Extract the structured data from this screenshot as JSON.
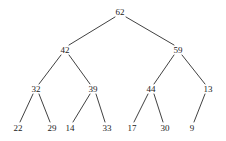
{
  "figure": {
    "kind": "binary-tree-diagram",
    "background_color": "#ffffff",
    "edge_color": "#2b2b2b",
    "text_color": "#1a1a1a",
    "width": 226,
    "height": 141
  },
  "nodes": [
    {
      "id": "n62",
      "label": "62",
      "x": 120,
      "y": 12,
      "level": 0
    },
    {
      "id": "n42",
      "label": "42",
      "x": 65,
      "y": 50,
      "level": 1
    },
    {
      "id": "n59",
      "label": "59",
      "x": 178,
      "y": 50,
      "level": 1
    },
    {
      "id": "n32",
      "label": "32",
      "x": 36,
      "y": 89,
      "level": 2
    },
    {
      "id": "n39",
      "label": "39",
      "x": 93,
      "y": 89,
      "level": 2
    },
    {
      "id": "n44",
      "label": "44",
      "x": 151,
      "y": 89,
      "level": 2
    },
    {
      "id": "n13",
      "label": "13",
      "x": 208,
      "y": 89,
      "level": 2
    },
    {
      "id": "n22",
      "label": "22",
      "x": 18,
      "y": 128,
      "level": 3
    },
    {
      "id": "n29",
      "label": "29",
      "x": 52,
      "y": 128,
      "level": 3
    },
    {
      "id": "n14",
      "label": "14",
      "x": 70,
      "y": 128,
      "level": 3
    },
    {
      "id": "n33",
      "label": "33",
      "x": 107,
      "y": 128,
      "level": 3
    },
    {
      "id": "n17",
      "label": "17",
      "x": 132,
      "y": 128,
      "level": 3
    },
    {
      "id": "n30",
      "label": "30",
      "x": 165,
      "y": 128,
      "level": 3
    },
    {
      "id": "n9",
      "label": "9",
      "x": 192,
      "y": 128,
      "level": 3
    }
  ],
  "edges": [
    {
      "from": "n62",
      "to": "n42",
      "x1": 115,
      "y1": 17,
      "x2": 69,
      "y2": 45
    },
    {
      "from": "n62",
      "to": "n59",
      "x1": 126,
      "y1": 17,
      "x2": 174,
      "y2": 45
    },
    {
      "from": "n42",
      "to": "n32",
      "x1": 61,
      "y1": 55,
      "x2": 39,
      "y2": 84
    },
    {
      "from": "n42",
      "to": "n39",
      "x1": 69,
      "y1": 55,
      "x2": 90,
      "y2": 84
    },
    {
      "from": "n59",
      "to": "n44",
      "x1": 174,
      "y1": 55,
      "x2": 154,
      "y2": 84
    },
    {
      "from": "n59",
      "to": "n13",
      "x1": 182,
      "y1": 55,
      "x2": 205,
      "y2": 84
    },
    {
      "from": "n32",
      "to": "n22",
      "x1": 33,
      "y1": 94,
      "x2": 20,
      "y2": 122
    },
    {
      "from": "n32",
      "to": "n29",
      "x1": 39,
      "y1": 94,
      "x2": 50,
      "y2": 122
    },
    {
      "from": "n39",
      "to": "n14",
      "x1": 90,
      "y1": 94,
      "x2": 73,
      "y2": 122
    },
    {
      "from": "n39",
      "to": "n33",
      "x1": 96,
      "y1": 94,
      "x2": 105,
      "y2": 122
    },
    {
      "from": "n44",
      "to": "n17",
      "x1": 148,
      "y1": 94,
      "x2": 134,
      "y2": 122
    },
    {
      "from": "n44",
      "to": "n30",
      "x1": 154,
      "y1": 94,
      "x2": 163,
      "y2": 122
    },
    {
      "from": "n13",
      "to": "n9",
      "x1": 205,
      "y1": 94,
      "x2": 194,
      "y2": 122
    }
  ]
}
